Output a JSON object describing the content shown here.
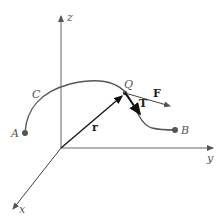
{
  "diagram": {
    "type": "3d-vector-curve",
    "axes": {
      "z": {
        "label": "z"
      },
      "y": {
        "label": "y"
      },
      "x": {
        "label": "x"
      }
    },
    "curve": {
      "label": "C",
      "start_point": "A",
      "end_point": "B"
    },
    "points": {
      "A": {
        "label": "A"
      },
      "B": {
        "label": "B"
      },
      "Q": {
        "label": "Q"
      }
    },
    "vectors": {
      "position": {
        "label": "r"
      },
      "force": {
        "label": "F"
      },
      "tangent": {
        "label": "T"
      }
    },
    "colors": {
      "axis": "#555555",
      "curve": "#555555",
      "vector": "#111111",
      "point": "#555555"
    }
  }
}
